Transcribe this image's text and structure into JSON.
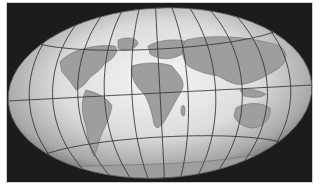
{
  "map": {
    "title": "",
    "projection": "Hammer-Aitoff (oblique tilt)",
    "background_color": "#1c1c1c",
    "globe_highlight": "#f4f4f4",
    "globe_edge": "#7a7a7a",
    "land_color": "#9e9e9e",
    "graticule_color": "#3a3a3a",
    "meridians_deg": [
      -180,
      -150,
      -120,
      -90,
      -60,
      -30,
      0,
      30,
      60,
      90,
      120,
      150,
      180
    ],
    "parallels_deg": [
      -60,
      -30,
      0,
      30,
      60
    ],
    "continents": [
      "North America",
      "South America",
      "Europe",
      "Africa",
      "Asia",
      "Australia",
      "Antarctica"
    ]
  }
}
